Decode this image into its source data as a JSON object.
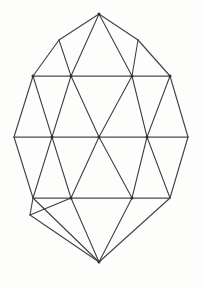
{
  "figure": {
    "shape_name": "egg-outline-triangular-mesh",
    "background_color": "#fdfdfc",
    "stroke_color": "#3b3b42",
    "canvas": {
      "width": 203,
      "height": 289
    }
  },
  "chart_data": {
    "type": "diagram",
    "xlabel": "",
    "ylabel": "",
    "xlim": [
      0,
      203
    ],
    "ylim": [
      0,
      289
    ],
    "grid": false,
    "legend": "none",
    "vertices": [
      {
        "id": "apex-top",
        "x": 99,
        "y": 14
      },
      {
        "id": "r1-left",
        "x": 59,
        "y": 40
      },
      {
        "id": "r1-right",
        "x": 138,
        "y": 40
      },
      {
        "id": "r2-left-end",
        "x": 33,
        "y": 76
      },
      {
        "id": "r2-a",
        "x": 71,
        "y": 76
      },
      {
        "id": "r2-b",
        "x": 132,
        "y": 76
      },
      {
        "id": "r2-right-end",
        "x": 170,
        "y": 76
      },
      {
        "id": "r3-left-end",
        "x": 14,
        "y": 137
      },
      {
        "id": "r3-a",
        "x": 52,
        "y": 137
      },
      {
        "id": "r3-center",
        "x": 99,
        "y": 137
      },
      {
        "id": "r3-b",
        "x": 147,
        "y": 137
      },
      {
        "id": "r3-right-end",
        "x": 188,
        "y": 137
      },
      {
        "id": "r4-left-end",
        "x": 33,
        "y": 198
      },
      {
        "id": "r4-a",
        "x": 71,
        "y": 198
      },
      {
        "id": "r4-b",
        "x": 132,
        "y": 198
      },
      {
        "id": "r4-right-end",
        "x": 170,
        "y": 198
      },
      {
        "id": "r5-left",
        "x": 30,
        "y": 215
      },
      {
        "id": "apex-bottom",
        "x": 99,
        "y": 262
      }
    ],
    "horizontal_rows": [
      {
        "id": "row-upper",
        "y": 76,
        "x_start": 33,
        "x_end": 170
      },
      {
        "id": "row-middle",
        "y": 137,
        "x_start": 14,
        "x_end": 188
      },
      {
        "id": "row-lower",
        "y": 198,
        "x_start": 33,
        "x_end": 170
      }
    ],
    "edges": [
      [
        "apex-top",
        "r1-left"
      ],
      [
        "apex-top",
        "r1-right"
      ],
      [
        "apex-top",
        "r2-a"
      ],
      [
        "apex-top",
        "r2-b"
      ],
      [
        "r1-left",
        "r2-left-end"
      ],
      [
        "r1-left",
        "r2-a"
      ],
      [
        "r1-right",
        "r2-b"
      ],
      [
        "r1-right",
        "r2-right-end"
      ],
      [
        "r2-left-end",
        "r2-right-end"
      ],
      [
        "r2-left-end",
        "r3-left-end"
      ],
      [
        "r2-left-end",
        "r3-a"
      ],
      [
        "r2-a",
        "r3-a"
      ],
      [
        "r2-a",
        "r3-center"
      ],
      [
        "r2-b",
        "r3-center"
      ],
      [
        "r2-b",
        "r3-b"
      ],
      [
        "r2-right-end",
        "r3-b"
      ],
      [
        "r2-right-end",
        "r3-right-end"
      ],
      [
        "r3-left-end",
        "r3-right-end"
      ],
      [
        "r3-left-end",
        "r4-left-end"
      ],
      [
        "r3-a",
        "r4-left-end"
      ],
      [
        "r3-a",
        "r4-a"
      ],
      [
        "r3-center",
        "r4-a"
      ],
      [
        "r3-center",
        "r4-b"
      ],
      [
        "r3-b",
        "r4-b"
      ],
      [
        "r3-b",
        "r4-right-end"
      ],
      [
        "r3-right-end",
        "r4-right-end"
      ],
      [
        "r4-left-end",
        "r4-right-end"
      ],
      [
        "r4-left-end",
        "r5-left"
      ],
      [
        "r4-left-end",
        "apex-bottom"
      ],
      [
        "r4-a",
        "r5-left"
      ],
      [
        "r4-a",
        "apex-bottom"
      ],
      [
        "r4-b",
        "apex-bottom"
      ],
      [
        "r4-right-end",
        "apex-bottom"
      ],
      [
        "r5-left",
        "apex-bottom"
      ]
    ],
    "marked_vertices": [
      "apex-top",
      "r2-left-end",
      "r2-a",
      "r2-b",
      "r2-right-end",
      "r3-a",
      "r3-center",
      "r3-b",
      "r4-a",
      "r4-b",
      "apex-bottom"
    ]
  }
}
